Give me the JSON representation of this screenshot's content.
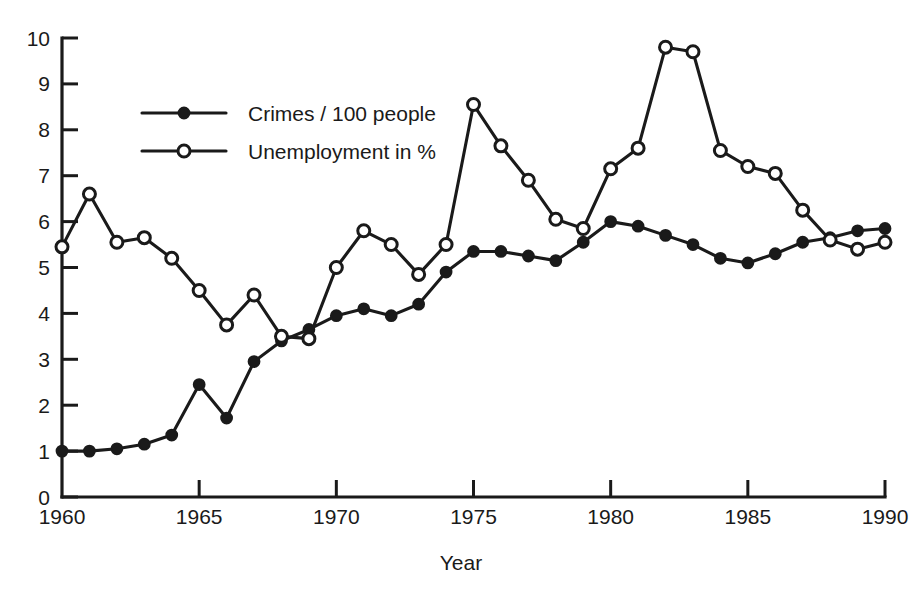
{
  "chart_data": {
    "type": "line",
    "title": "",
    "xlabel": "Year",
    "ylabel": "",
    "xlim": [
      1960,
      1990
    ],
    "ylim": [
      0,
      10
    ],
    "grid": false,
    "legend_position": "upper-left-inside",
    "x": [
      1960,
      1961,
      1962,
      1963,
      1964,
      1965,
      1966,
      1967,
      1968,
      1969,
      1970,
      1971,
      1972,
      1973,
      1974,
      1975,
      1976,
      1977,
      1978,
      1979,
      1980,
      1981,
      1982,
      1983,
      1984,
      1985,
      1986,
      1987,
      1988,
      1989,
      1990
    ],
    "xticks": [
      1960,
      1965,
      1970,
      1975,
      1980,
      1985,
      1990
    ],
    "xtick_labels": [
      "1960",
      "1965",
      "1970",
      "1975",
      "1980",
      "1985",
      "1990"
    ],
    "yticks": [
      0,
      1,
      2,
      3,
      4,
      5,
      6,
      7,
      8,
      9,
      10
    ],
    "ytick_labels": [
      "0",
      "1",
      "2",
      "3",
      "4",
      "5",
      "6",
      "7",
      "8",
      "9",
      "10"
    ],
    "series": [
      {
        "name": "Crimes / 100 people",
        "marker": "filled-circle",
        "values": [
          1.0,
          1.0,
          1.05,
          1.15,
          1.35,
          2.45,
          1.72,
          2.95,
          3.4,
          3.65,
          3.95,
          4.1,
          3.95,
          4.2,
          4.9,
          5.35,
          5.35,
          5.25,
          5.15,
          5.55,
          6.0,
          5.9,
          5.7,
          5.5,
          5.2,
          5.1,
          5.3,
          5.55,
          5.65,
          5.8,
          5.85
        ]
      },
      {
        "name": "Unemployment in %",
        "marker": "open-circle",
        "values": [
          5.45,
          6.6,
          5.55,
          5.65,
          5.2,
          4.5,
          3.75,
          4.4,
          3.5,
          3.45,
          5.0,
          5.8,
          5.5,
          4.85,
          5.5,
          8.55,
          7.65,
          6.9,
          6.05,
          5.85,
          7.15,
          7.6,
          9.8,
          9.7,
          7.55,
          7.2,
          7.05,
          6.25,
          5.6,
          5.4,
          5.55
        ]
      }
    ]
  },
  "legend": {
    "entries": [
      {
        "label": "Crimes / 100 people",
        "marker": "filled-circle"
      },
      {
        "label": "Unemployment in %",
        "marker": "open-circle"
      }
    ]
  },
  "axis": {
    "x_title": "Year"
  }
}
